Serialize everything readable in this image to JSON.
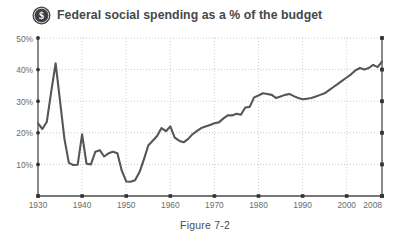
{
  "figure": {
    "title": "Federal social spending as a % of the budget",
    "caption": "Figure 7-2",
    "badge_icon": "dollar-coin-icon",
    "colors": {
      "line": "#55565a",
      "axis": "#4a4a4a",
      "grid": "#b9b9b9",
      "tick_text": "#6b6b6b",
      "title_text": "#46484a",
      "background": "#ffffff"
    }
  },
  "chart_data": {
    "type": "line",
    "title": "Federal social spending as a % of the budget",
    "xlabel": "",
    "ylabel": "",
    "xlim": [
      1930,
      2008
    ],
    "ylim": [
      0,
      50
    ],
    "grid": true,
    "legend": "none",
    "y_ticks": [
      0,
      10,
      20,
      30,
      40,
      50
    ],
    "y_tick_labels": [
      "",
      "10%",
      "20%",
      "30%",
      "40%",
      "50%"
    ],
    "x_ticks": [
      1930,
      1940,
      1950,
      1960,
      1970,
      1980,
      1990,
      2000,
      2008
    ],
    "x_tick_labels": [
      "1930",
      "1940",
      "1950",
      "1960",
      "1970",
      "1980",
      "1990",
      "2000",
      "2008"
    ],
    "series": [
      {
        "name": "Federal social spending (% of budget)",
        "x": [
          1930,
          1931,
          1932,
          1933,
          1934,
          1935,
          1936,
          1937,
          1938,
          1939,
          1940,
          1941,
          1942,
          1943,
          1944,
          1945,
          1946,
          1947,
          1948,
          1949,
          1950,
          1951,
          1952,
          1953,
          1954,
          1955,
          1956,
          1957,
          1958,
          1959,
          1960,
          1961,
          1962,
          1963,
          1964,
          1965,
          1966,
          1967,
          1968,
          1969,
          1970,
          1971,
          1972,
          1973,
          1974,
          1975,
          1976,
          1977,
          1978,
          1979,
          1980,
          1981,
          1982,
          1983,
          1984,
          1985,
          1986,
          1987,
          1988,
          1989,
          1990,
          1991,
          1992,
          1993,
          1994,
          1995,
          1996,
          1997,
          1998,
          1999,
          2000,
          2001,
          2002,
          2003,
          2004,
          2005,
          2006,
          2007,
          2008
        ],
        "y": [
          23.0,
          21.2,
          23.5,
          33.0,
          42.0,
          30.0,
          18.0,
          10.5,
          9.8,
          9.9,
          19.5,
          10.2,
          10.0,
          14.0,
          14.5,
          12.5,
          13.5,
          14.0,
          13.5,
          8.0,
          4.6,
          4.5,
          5.0,
          7.5,
          11.5,
          16.0,
          17.5,
          19.0,
          21.5,
          20.5,
          22.0,
          18.5,
          17.5,
          17.0,
          18.0,
          19.5,
          20.5,
          21.5,
          22.0,
          22.5,
          23.0,
          23.3,
          24.5,
          25.5,
          25.5,
          26.0,
          25.7,
          28.0,
          28.2,
          31.2,
          31.8,
          32.5,
          32.3,
          32.0,
          31.0,
          31.5,
          32.0,
          32.3,
          31.6,
          31.0,
          30.6,
          30.8,
          31.0,
          31.5,
          32.0,
          32.5,
          33.5,
          34.5,
          35.5,
          36.5,
          37.5,
          38.5,
          39.8,
          40.5,
          40.0,
          40.5,
          41.5,
          40.8,
          42.5
        ]
      }
    ],
    "annotations": []
  }
}
